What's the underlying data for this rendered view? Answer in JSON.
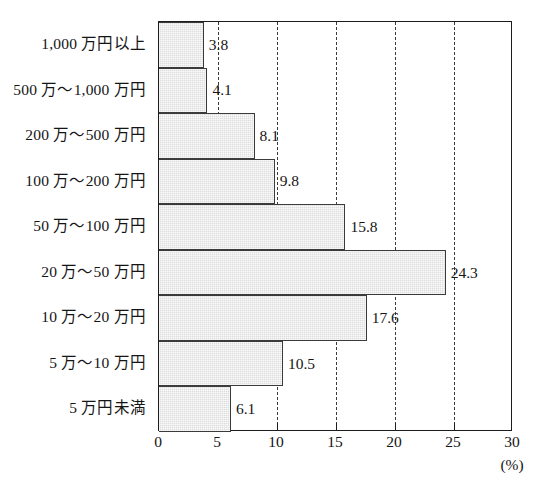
{
  "chart_data": {
    "type": "bar",
    "orientation": "horizontal",
    "title": "",
    "xlabel": "(%)",
    "ylabel": "",
    "categories": [
      "1,000 万円以上",
      "500 万～1,000 万円",
      "200 万～500 万円",
      "100 万～200 万円",
      "50 万～100 万円",
      "20 万～50 万円",
      "10 万～20 万円",
      "5 万～10 万円",
      "5 万円未満"
    ],
    "values": [
      3.8,
      4.1,
      8.1,
      9.8,
      15.8,
      24.3,
      17.6,
      10.5,
      6.1
    ],
    "value_labels": [
      "3.8",
      "4.1",
      "8.1",
      "9.8",
      "15.8",
      "24.3",
      "17.6",
      "10.5",
      "6.1"
    ],
    "xlim": [
      0,
      30
    ],
    "xticks": [
      0,
      5,
      10,
      15,
      20,
      25,
      30
    ],
    "xtick_labels": [
      "0",
      "5",
      "10",
      "15",
      "20",
      "25",
      "30"
    ],
    "gridlines": [
      5,
      10,
      15,
      20,
      25
    ],
    "grid": true,
    "grid_style": "dashed",
    "legend": null,
    "unit": "(%)",
    "colors": {
      "bar_fill": "#dedede",
      "bar_border": "#3b3b3b",
      "axis": "#1c1c1c",
      "grid": "#3a3a3a",
      "text": "#151515",
      "background": "#ffffff"
    }
  }
}
